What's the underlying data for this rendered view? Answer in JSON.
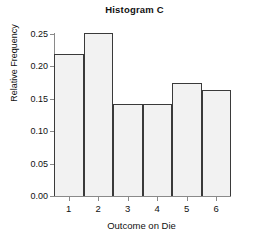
{
  "chart_data": {
    "type": "bar",
    "title": "Histogram C",
    "xlabel": "Outcome on Die",
    "ylabel": "Relative Frequency",
    "categories": [
      "1",
      "2",
      "3",
      "4",
      "5",
      "6"
    ],
    "values": [
      0.218,
      0.25,
      0.141,
      0.141,
      0.173,
      0.162
    ],
    "ylim": [
      0.0,
      0.25
    ],
    "xlim": [
      0.5,
      6.5
    ],
    "ytick_labels": [
      "0.00",
      "0.05",
      "0.10",
      "0.15",
      "0.20",
      "0.25"
    ],
    "ytick_values": [
      0.0,
      0.05,
      0.1,
      0.15,
      0.2,
      0.25
    ],
    "xtick_labels": [
      "1",
      "2",
      "3",
      "4",
      "5",
      "6"
    ],
    "grid": false,
    "legend": null,
    "bar_fill_color": "#f2f2f2",
    "bar_edge_color": "#3a3a3a",
    "axis_color": "#8a8a8a",
    "text_color": "#111111",
    "background_color": "#ffffff"
  }
}
